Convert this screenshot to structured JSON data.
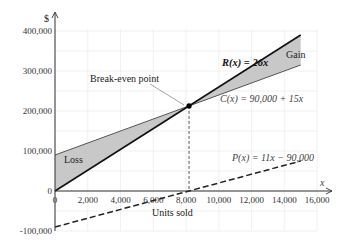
{
  "chart_data": {
    "type": "line",
    "title": "",
    "xlabel": "Units sold",
    "ylabel": "$",
    "x_axis_symbol": "x",
    "xlim": [
      0,
      16000
    ],
    "ylim": [
      -100000,
      400000
    ],
    "x_ticks": [
      0,
      2000,
      4000,
      6000,
      8000,
      10000,
      12000,
      14000,
      16000
    ],
    "x_tick_labels": [
      "0",
      "2,000",
      "4,000",
      "6,000",
      "8,000",
      "10,000",
      "12,000",
      "14,000",
      "16,000"
    ],
    "y_ticks": [
      -100000,
      0,
      100000,
      200000,
      300000,
      400000
    ],
    "y_tick_labels": [
      "-100,000",
      "0",
      "100,000",
      "200,000",
      "300,000",
      "400,000"
    ],
    "grid": true,
    "series": [
      {
        "name": "R(x) = 26x",
        "style": "solid-bold",
        "x": [
          0,
          15000
        ],
        "values": [
          0,
          390000
        ]
      },
      {
        "name": "C(x) = 90,000 + 15x",
        "style": "solid",
        "x": [
          0,
          15000
        ],
        "values": [
          90000,
          315000
        ]
      },
      {
        "name": "P(x) = 11x − 90,000",
        "style": "dashed",
        "x": [
          0,
          15000
        ],
        "values": [
          -90000,
          75000
        ]
      }
    ],
    "break_even": {
      "x": 8182,
      "y": 212727,
      "label": "Break-even point"
    },
    "regions": [
      {
        "label": "Loss",
        "x_range": [
          0,
          8182
        ],
        "between": [
          "C(x)",
          "R(x)"
        ]
      },
      {
        "label": "Gain",
        "x_range": [
          8182,
          15000
        ],
        "between": [
          "R(x)",
          "C(x)"
        ]
      }
    ]
  },
  "labels": {
    "y_symbol": "$",
    "x_symbol": "x",
    "xlabel": "Units sold",
    "revenue": "R(x) = 26x",
    "cost": "C(x) = 90,000 + 15x",
    "profit": "P(x) = 11x − 90,000",
    "break_even": "Break-even point",
    "loss": "Loss",
    "gain": "Gain"
  }
}
